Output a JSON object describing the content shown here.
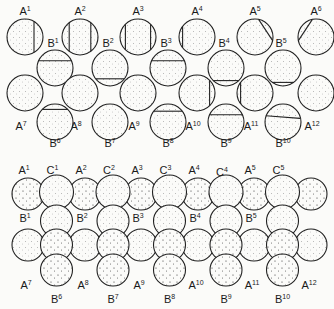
{
  "top_panel": {
    "row1_labels": [
      "A1",
      "A2",
      "A3",
      "A4",
      "A5",
      "A6"
    ],
    "row2_labels": [
      "B1",
      "B2",
      "B3",
      "B4",
      "B5"
    ],
    "row3_labels": [
      "A7",
      "A8",
      "A9",
      "A10",
      "A11",
      "A12"
    ],
    "row4_labels": [
      "B6",
      "B7",
      "B8",
      "B9",
      "B10"
    ],
    "cx_A": [
      25,
      80,
      138,
      197,
      255,
      316
    ],
    "cx_B": [
      55,
      110,
      168,
      226,
      283
    ],
    "cy": [
      37,
      68,
      93,
      122
    ],
    "r": 18,
    "row1_lines": [
      {
        "type": "v",
        "pos": 0.75
      },
      {
        "type": "v2",
        "pos": [
          0.2,
          0.8
        ]
      },
      {
        "type": "v2",
        "pos": [
          0.15,
          0.85
        ]
      },
      {
        "type": "v",
        "pos": 0.1
      },
      {
        "type": "d",
        "pos": "right"
      },
      {
        "type": "d",
        "pos": "left"
      }
    ],
    "row2_lines": [
      {
        "type": "h",
        "pos": 0.3
      },
      {
        "type": "h",
        "pos": 0.8
      },
      {
        "type": "h",
        "pos": 0.3
      },
      {
        "type": "h",
        "pos": 0.85
      },
      {
        "type": "h",
        "pos": 0.9
      }
    ],
    "row3_lines": [
      {
        "type": "none"
      },
      {
        "type": "none"
      },
      {
        "type": "none"
      },
      {
        "type": "v",
        "pos": 0.85
      },
      {
        "type": "v",
        "pos": 0.1
      },
      {
        "type": "none"
      }
    ],
    "row4_lines": [
      {
        "type": "h",
        "pos": 0.15
      },
      {
        "type": "none"
      },
      {
        "type": "h",
        "pos": 0.2
      },
      {
        "type": "h",
        "pos": 0.3
      },
      {
        "type": "d",
        "pos": "top"
      }
    ]
  },
  "bottom_panel": {
    "row1_labels": [
      "A1",
      "C1",
      "A2",
      "C2",
      "A3",
      "C3",
      "A4",
      "C4",
      "A5",
      "C5"
    ],
    "row2_labels": [
      "B1",
      "B2",
      "B3",
      "B4",
      "B5"
    ],
    "row3_labels": [
      "A7",
      "A8",
      "A9",
      "A10",
      "A11",
      "A12"
    ],
    "row4_labels": [
      "B6",
      "B7",
      "B8",
      "B9",
      "B10"
    ],
    "cx_A": [
      28,
      85,
      141,
      198,
      254,
      311
    ],
    "cy": [
      194,
      218,
      245,
      270
    ],
    "r": 16
  }
}
